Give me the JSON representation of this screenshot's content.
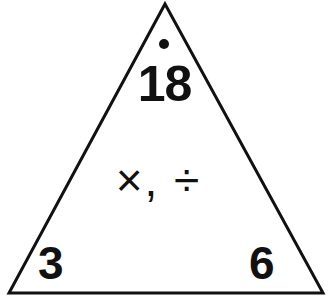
{
  "card": {
    "name": "fact-family-triangle",
    "background_color": "#ffffff",
    "ink_color": "#111111"
  },
  "triangle": {
    "stroke_color": "#111111",
    "stroke_width": 3,
    "fill_color": "#ffffff",
    "apex": {
      "x": 165,
      "y": 4
    },
    "bottom_left": {
      "x": 9,
      "y": 293
    },
    "bottom_right": {
      "x": 323,
      "y": 293
    }
  },
  "marker": {
    "dot_label": "dot",
    "color": "#111111"
  },
  "content": {
    "product": "18",
    "operators": "×, ÷",
    "factor_left": "3",
    "factor_right": "6"
  },
  "chart_data": {
    "type": "diagram",
    "title": "",
    "diagram_kind": "fact-family-triangle",
    "vertices": [
      {
        "position": "top",
        "label": "18",
        "role": "product"
      },
      {
        "position": "bottom-left",
        "label": "3",
        "role": "factor"
      },
      {
        "position": "bottom-right",
        "label": "6",
        "role": "factor"
      }
    ],
    "center_label": "×, ÷",
    "operations": [
      "×",
      "÷"
    ],
    "annotations": [
      {
        "kind": "dot",
        "near": "18",
        "meaning": "marker above product"
      }
    ]
  }
}
